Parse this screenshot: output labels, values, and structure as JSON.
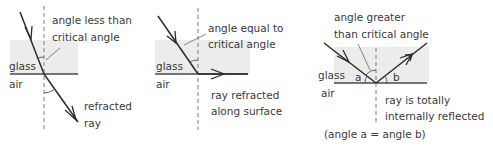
{
  "diagram": {
    "media": {
      "upper": "glass",
      "lower": "air"
    },
    "panels": [
      {
        "id": "less-than-critical",
        "label_lines": [
          "angle less than",
          "critical angle"
        ],
        "medium_top": "glass",
        "medium_bottom": "air",
        "outcome_lines": [
          "refracted",
          "ray"
        ]
      },
      {
        "id": "equal-to-critical",
        "label_lines": [
          "angle equal to",
          "critical angle"
        ],
        "medium_top": "glass",
        "medium_bottom": "air",
        "outcome_lines": [
          "ray refracted",
          "along surface"
        ]
      },
      {
        "id": "greater-than-critical",
        "label_lines": [
          "angle greater",
          "than critical angle"
        ],
        "medium_top": "glass",
        "medium_bottom": "air",
        "angle_a": "a",
        "angle_b": "b",
        "outcome_lines": [
          "ray is totally",
          "internally reflected"
        ],
        "note": "(angle a = angle b)"
      }
    ]
  },
  "colors": {
    "glass_fill": "#ececec",
    "line": "#2b2b2b",
    "text": "#3a3a3a"
  }
}
